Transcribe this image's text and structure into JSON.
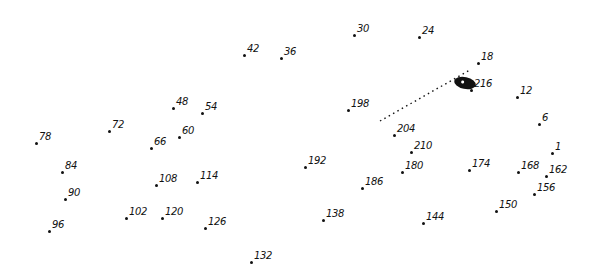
{
  "puzzle": {
    "type": "connect-the-dots",
    "points": [
      {
        "label": "1",
        "x": 552,
        "y": 153
      },
      {
        "label": "6",
        "x": 539,
        "y": 124
      },
      {
        "label": "12",
        "x": 517,
        "y": 97
      },
      {
        "label": "18",
        "x": 478,
        "y": 63
      },
      {
        "label": "24",
        "x": 419,
        "y": 37
      },
      {
        "label": "30",
        "x": 354,
        "y": 35
      },
      {
        "label": "36",
        "x": 281,
        "y": 58
      },
      {
        "label": "42",
        "x": 244,
        "y": 55
      },
      {
        "label": "48",
        "x": 173,
        "y": 108
      },
      {
        "label": "54",
        "x": 202,
        "y": 113
      },
      {
        "label": "60",
        "x": 179,
        "y": 137
      },
      {
        "label": "66",
        "x": 151,
        "y": 148
      },
      {
        "label": "72",
        "x": 109,
        "y": 131
      },
      {
        "label": "78",
        "x": 36,
        "y": 143
      },
      {
        "label": "84",
        "x": 62,
        "y": 172
      },
      {
        "label": "90",
        "x": 65,
        "y": 199
      },
      {
        "label": "96",
        "x": 49,
        "y": 231
      },
      {
        "label": "102",
        "x": 126,
        "y": 218
      },
      {
        "label": "108",
        "x": 156,
        "y": 185
      },
      {
        "label": "114",
        "x": 197,
        "y": 182
      },
      {
        "label": "120",
        "x": 162,
        "y": 218
      },
      {
        "label": "126",
        "x": 205,
        "y": 228
      },
      {
        "label": "132",
        "x": 251,
        "y": 262
      },
      {
        "label": "138",
        "x": 323,
        "y": 220
      },
      {
        "label": "144",
        "x": 423,
        "y": 223
      },
      {
        "label": "150",
        "x": 496,
        "y": 211
      },
      {
        "label": "156",
        "x": 534,
        "y": 194
      },
      {
        "label": "162",
        "x": 546,
        "y": 176
      },
      {
        "label": "168",
        "x": 518,
        "y": 172
      },
      {
        "label": "174",
        "x": 469,
        "y": 170
      },
      {
        "label": "180",
        "x": 402,
        "y": 172
      },
      {
        "label": "186",
        "x": 362,
        "y": 188
      },
      {
        "label": "192",
        "x": 305,
        "y": 167
      },
      {
        "label": "198",
        "x": 348,
        "y": 110
      },
      {
        "label": "204",
        "x": 394,
        "y": 135
      },
      {
        "label": "210",
        "x": 411,
        "y": 152
      },
      {
        "label": "216",
        "x": 471,
        "y": 90
      }
    ]
  }
}
